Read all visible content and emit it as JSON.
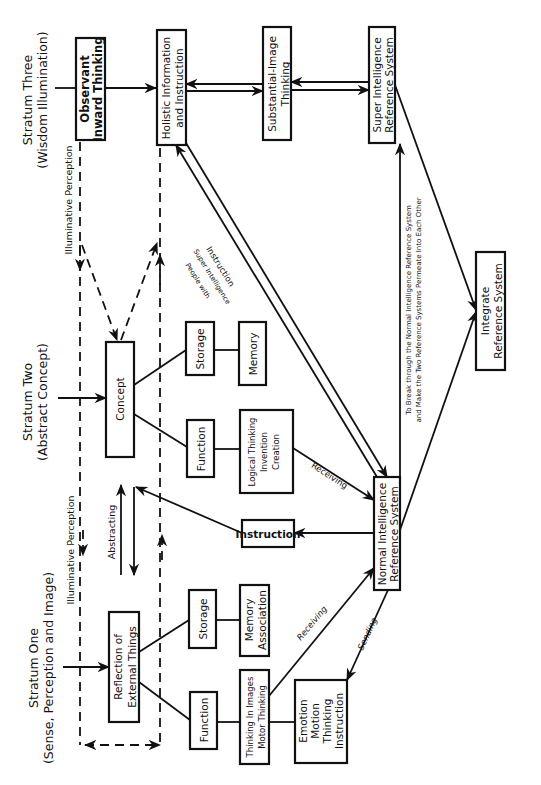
{
  "strata": {
    "three": {
      "title": "Stratum Three",
      "subtitle": "(Wisdom Illumination)"
    },
    "two": {
      "title": "Stratum Two",
      "subtitle": "(Abstract Concept)"
    },
    "one": {
      "title": "Stratum One",
      "subtitle": "(Sense, Perception and Image)"
    }
  },
  "boxes": {
    "observant": [
      "Observant",
      "Inward Thinking"
    ],
    "holistic": [
      "Holistic Information",
      "and Instruction"
    ],
    "substantial": [
      "Substantial-Image",
      "Thinking"
    ],
    "super": [
      "Super Intelligence",
      "Reference System"
    ],
    "concept": [
      "Concept"
    ],
    "storage2": [
      "Storage"
    ],
    "memory2": [
      "Memory"
    ],
    "function2": [
      "Function"
    ],
    "logical": [
      "Logical Thinking",
      "Invention",
      "Creation"
    ],
    "instruction": [
      "Instruction"
    ],
    "normal": [
      "Normal Intelligence",
      "Reference System"
    ],
    "integrate": [
      "Integrate",
      "Reference System"
    ],
    "reflection": [
      "Reflection of",
      "External Things"
    ],
    "storage1": [
      "Storage"
    ],
    "memory1": [
      "Memory",
      "Association"
    ],
    "function1": [
      "Function"
    ],
    "images": [
      "Thinking In Images",
      "Motor Thinking"
    ],
    "emotion": [
      "Emotion",
      "Motion",
      "Thinking",
      "Instruction"
    ]
  },
  "labels": {
    "illuminative_top": "Illuminative Perception",
    "illuminative_bottom": "Illuminative Perception",
    "abstracting": "Abstracting",
    "instruction_diag": "Instruction",
    "people_with": "People with",
    "super_intel": "Super Intelligence",
    "receiving_upper": "Receiving",
    "receiving_lower": "Receiving",
    "sending": "Sending",
    "break_through_1": "To Break through the Normal Intelligence Reference System",
    "break_through_2": "and Make the Two Reference Systems Permeate Into Each Other"
  }
}
